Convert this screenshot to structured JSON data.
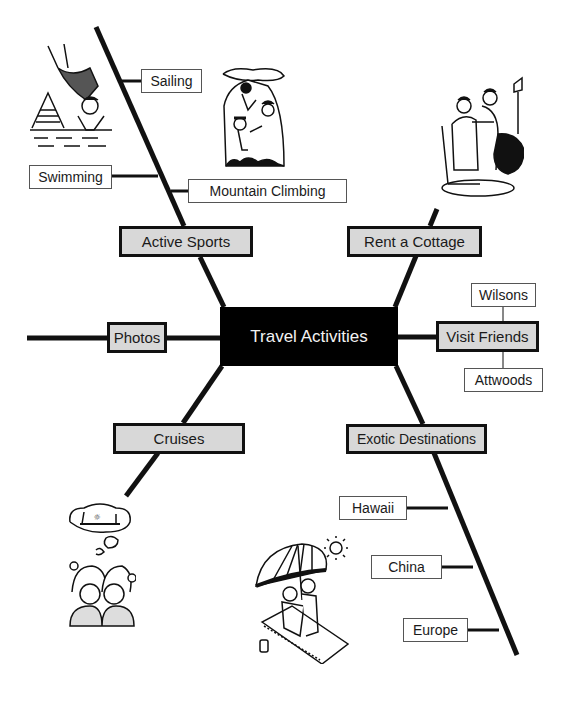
{
  "diagram": {
    "type": "mind-map",
    "center": {
      "label": "Travel Activities",
      "color": "#000000",
      "text_color": "#f2f2f2"
    },
    "branches": [
      {
        "id": "active-sports",
        "label": "Active Sports",
        "children": [
          "Sailing",
          "Swimming",
          "Mountain Climbing"
        ],
        "illustrations": [
          "swimmer-diving-clipart",
          "mountain-climbers-clipart"
        ]
      },
      {
        "id": "rent-cottage",
        "label": "Rent a Cottage",
        "children": [],
        "illustrations": [
          "couple-by-wood-stove-clipart"
        ]
      },
      {
        "id": "photos",
        "label": "Photos",
        "children": [],
        "illustrations": []
      },
      {
        "id": "visit-friends",
        "label": "Visit Friends",
        "children": [
          "Wilsons",
          "Attwoods"
        ],
        "illustrations": []
      },
      {
        "id": "cruises",
        "label": "Cruises",
        "children": [],
        "illustrations": [
          "couple-dreaming-of-island-clipart"
        ]
      },
      {
        "id": "exotic-destinations",
        "label": "Exotic Destinations",
        "children": [
          "Hawaii",
          "China",
          "Europe"
        ],
        "illustrations": [
          "couple-under-beach-umbrella-clipart"
        ]
      }
    ],
    "colors": {
      "main_box_fill": "#d8d8d8",
      "leaf_box_fill": "#ffffff",
      "line": "#111111"
    }
  }
}
